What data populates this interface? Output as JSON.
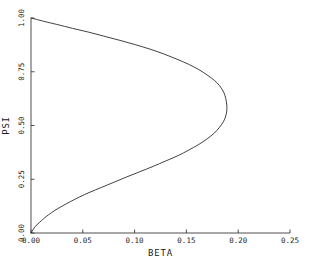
{
  "chart_data": {
    "type": "line",
    "title": "",
    "subtitle": "",
    "xlabel": "BETA",
    "ylabel": "PSI",
    "xlim": [
      0.0,
      0.25
    ],
    "ylim": [
      0.0,
      1.0
    ],
    "xticks": [
      "0.00",
      "0.05",
      "0.10",
      "0.15",
      "0.20",
      "0.25"
    ],
    "xtick_values": [
      0.0,
      0.05,
      0.1,
      0.15,
      0.2,
      0.25
    ],
    "yticks": [
      "0.00",
      "0.25",
      "0.50",
      "0.75",
      "1.00"
    ],
    "ytick_values": [
      0.0,
      0.25,
      0.5,
      0.75,
      1.0
    ],
    "grid": false,
    "legend": "none",
    "annotations": [],
    "series": [
      {
        "name": "beta-psi-curve",
        "comment": "Single continuous C-shaped curve, parameterized by PSI from 1.00 down to 0.00; BETA is a folded (two-valued) function of PSI with a turning point near BETA=0.189 at PSI=0.57.",
        "points": [
          {
            "beta": 0.0,
            "psi": 1.0
          },
          {
            "beta": 0.012,
            "psi": 0.985
          },
          {
            "beta": 0.025,
            "psi": 0.97
          },
          {
            "beta": 0.04,
            "psi": 0.952
          },
          {
            "beta": 0.055,
            "psi": 0.935
          },
          {
            "beta": 0.07,
            "psi": 0.916
          },
          {
            "beta": 0.085,
            "psi": 0.897
          },
          {
            "beta": 0.1,
            "psi": 0.877
          },
          {
            "beta": 0.115,
            "psi": 0.855
          },
          {
            "beta": 0.128,
            "psi": 0.833
          },
          {
            "beta": 0.14,
            "psi": 0.81
          },
          {
            "beta": 0.152,
            "psi": 0.785
          },
          {
            "beta": 0.162,
            "psi": 0.76
          },
          {
            "beta": 0.17,
            "psi": 0.735
          },
          {
            "beta": 0.177,
            "psi": 0.71
          },
          {
            "beta": 0.182,
            "psi": 0.685
          },
          {
            "beta": 0.186,
            "psi": 0.655
          },
          {
            "beta": 0.188,
            "psi": 0.625
          },
          {
            "beta": 0.189,
            "psi": 0.595
          },
          {
            "beta": 0.189,
            "psi": 0.57
          },
          {
            "beta": 0.188,
            "psi": 0.545
          },
          {
            "beta": 0.186,
            "psi": 0.52
          },
          {
            "beta": 0.182,
            "psi": 0.492
          },
          {
            "beta": 0.177,
            "psi": 0.465
          },
          {
            "beta": 0.17,
            "psi": 0.438
          },
          {
            "beta": 0.162,
            "psi": 0.412
          },
          {
            "beta": 0.152,
            "psi": 0.385
          },
          {
            "beta": 0.142,
            "psi": 0.36
          },
          {
            "beta": 0.13,
            "psi": 0.335
          },
          {
            "beta": 0.118,
            "psi": 0.31
          },
          {
            "beta": 0.105,
            "psi": 0.285
          },
          {
            "beta": 0.092,
            "psi": 0.26
          },
          {
            "beta": 0.08,
            "psi": 0.236
          },
          {
            "beta": 0.068,
            "psi": 0.212
          },
          {
            "beta": 0.057,
            "psi": 0.19
          },
          {
            "beta": 0.047,
            "psi": 0.168
          },
          {
            "beta": 0.038,
            "psi": 0.146
          },
          {
            "beta": 0.03,
            "psi": 0.125
          },
          {
            "beta": 0.023,
            "psi": 0.105
          },
          {
            "beta": 0.017,
            "psi": 0.085
          },
          {
            "beta": 0.012,
            "psi": 0.066
          },
          {
            "beta": 0.008,
            "psi": 0.048
          },
          {
            "beta": 0.004,
            "psi": 0.03
          },
          {
            "beta": 0.002,
            "psi": 0.015
          },
          {
            "beta": 0.0,
            "psi": 0.0
          }
        ]
      }
    ]
  }
}
